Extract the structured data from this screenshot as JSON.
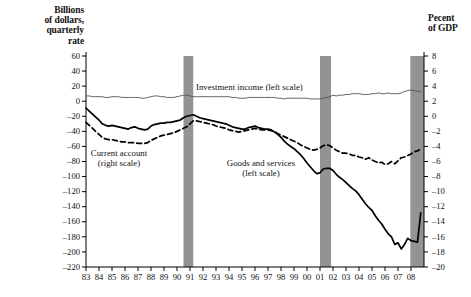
{
  "left_axis": {
    "title": "Billions\nof dollars,\nquarterly\nrate",
    "title_lines": [
      "Billions",
      "of dollars,",
      "quarterly",
      "rate"
    ],
    "ticks": [
      60,
      40,
      20,
      0,
      -20,
      -40,
      -60,
      -80,
      -100,
      -120,
      -140,
      -160,
      -180,
      -200,
      -220
    ],
    "min": -220,
    "max": 60
  },
  "right_axis": {
    "title_lines": [
      "Pecent",
      "of GDP"
    ],
    "ticks": [
      8,
      6,
      4,
      2,
      0,
      -2,
      -4,
      -6,
      -8,
      -10,
      -12,
      -14,
      -16,
      -18,
      -20
    ],
    "min": -20,
    "max": 8
  },
  "x_axis": {
    "labels": [
      "83",
      "84",
      "85",
      "86",
      "87",
      "88",
      "89",
      "90",
      "91",
      "92",
      "93",
      "94",
      "95",
      "96",
      "97",
      "98",
      "99",
      "00",
      "01",
      "02",
      "03",
      "04",
      "05",
      "06",
      "07",
      "08"
    ],
    "min": 1983,
    "max": 2009
  },
  "series_labels": {
    "investment": "Investment income (left scale)",
    "current_account_line1": "Current account",
    "current_account_line2": "(right scale)",
    "goods_line1": "Goods and services",
    "goods_line2": "(left scale)"
  },
  "colors": {
    "investment_income": "#555555",
    "goods_services": "#000000",
    "current_account": "#000000",
    "recession_band": "#939393",
    "axis": "#000000",
    "background": "#ffffff"
  },
  "recessions": [
    {
      "start": 1990.5,
      "end": 1991.25
    },
    {
      "start": 2001.0,
      "end": 2001.85
    },
    {
      "start": 2007.95,
      "end": 2009.0
    }
  ],
  "chart_data": {
    "type": "line",
    "title": "",
    "xlabel": "",
    "ylabel": "Billions of dollars, quarterly rate",
    "ylabel_right": "Pecent of GDP",
    "ylim": [
      -220,
      60
    ],
    "ylim_right": [
      -20,
      8
    ],
    "xlim": [
      1983,
      2009
    ],
    "grid": false,
    "legend": "inline-annotations",
    "x": [
      1983.0,
      1983.25,
      1983.5,
      1983.75,
      1984.0,
      1984.25,
      1984.5,
      1984.75,
      1985.0,
      1985.25,
      1985.5,
      1985.75,
      1986.0,
      1986.25,
      1986.5,
      1986.75,
      1987.0,
      1987.25,
      1987.5,
      1987.75,
      1988.0,
      1988.25,
      1988.5,
      1988.75,
      1989.0,
      1989.25,
      1989.5,
      1989.75,
      1990.0,
      1990.25,
      1990.5,
      1990.75,
      1991.0,
      1991.25,
      1991.5,
      1991.75,
      1992.0,
      1992.25,
      1992.5,
      1992.75,
      1993.0,
      1993.25,
      1993.5,
      1993.75,
      1994.0,
      1994.25,
      1994.5,
      1994.75,
      1995.0,
      1995.25,
      1995.5,
      1995.75,
      1996.0,
      1996.25,
      1996.5,
      1996.75,
      1997.0,
      1997.25,
      1997.5,
      1997.75,
      1998.0,
      1998.25,
      1998.5,
      1998.75,
      1999.0,
      1999.25,
      1999.5,
      1999.75,
      2000.0,
      2000.25,
      2000.5,
      2000.75,
      2001.0,
      2001.25,
      2001.5,
      2001.75,
      2002.0,
      2002.25,
      2002.5,
      2002.75,
      2003.0,
      2003.25,
      2003.5,
      2003.75,
      2004.0,
      2004.25,
      2004.5,
      2004.75,
      2005.0,
      2005.25,
      2005.5,
      2005.75,
      2006.0,
      2006.25,
      2006.5,
      2006.75,
      2007.0,
      2007.25,
      2007.5,
      2007.75,
      2008.0,
      2008.25,
      2008.5,
      2008.75
    ],
    "series": [
      {
        "name": "Investment income (left scale)",
        "axis": "left",
        "style": "solid-thin",
        "color": "#555555",
        "values": [
          7,
          7,
          6,
          6,
          6,
          6,
          5,
          5,
          6,
          6,
          6,
          5,
          5,
          5,
          5,
          5,
          5,
          4,
          4,
          5,
          6,
          7,
          7,
          6,
          6,
          5,
          5,
          5,
          6,
          7,
          8,
          8,
          7,
          6,
          6,
          6,
          6,
          6,
          6,
          6,
          6,
          6,
          6,
          6,
          6,
          5,
          5,
          4,
          4,
          4,
          5,
          5,
          5,
          5,
          5,
          5,
          5,
          5,
          5,
          4,
          4,
          3,
          4,
          4,
          4,
          4,
          4,
          4,
          4,
          3,
          3,
          3,
          3,
          4,
          5,
          6,
          8,
          7,
          8,
          8,
          9,
          9,
          10,
          10,
          10,
          9,
          9,
          9,
          10,
          10,
          11,
          10,
          10,
          11,
          10,
          10,
          10,
          11,
          13,
          14,
          15,
          14,
          13,
          13
        ]
      },
      {
        "name": "Goods and services (left scale)",
        "axis": "left",
        "style": "solid-thick",
        "color": "#000000",
        "values": [
          -9,
          -13,
          -17,
          -21,
          -25,
          -30,
          -32,
          -33,
          -32,
          -33,
          -34,
          -35,
          -36,
          -37,
          -35,
          -34,
          -36,
          -37,
          -38,
          -37,
          -33,
          -31,
          -30,
          -29,
          -29,
          -28,
          -28,
          -27,
          -26,
          -25,
          -22,
          -20,
          -19,
          -18,
          -20,
          -22,
          -23,
          -24,
          -25,
          -26,
          -27,
          -28,
          -29,
          -30,
          -32,
          -34,
          -35,
          -36,
          -37,
          -37,
          -35,
          -34,
          -33,
          -35,
          -36,
          -37,
          -37,
          -38,
          -41,
          -44,
          -48,
          -53,
          -57,
          -60,
          -63,
          -67,
          -71,
          -76,
          -82,
          -87,
          -92,
          -96,
          -95,
          -90,
          -89,
          -89,
          -92,
          -97,
          -101,
          -104,
          -108,
          -112,
          -116,
          -119,
          -124,
          -130,
          -136,
          -141,
          -145,
          -152,
          -158,
          -163,
          -170,
          -176,
          -180,
          -190,
          -188,
          -196,
          -190,
          -182,
          -185,
          -186,
          -187,
          -148
        ]
      },
      {
        "name": "Current account (right scale)",
        "axis": "right",
        "style": "dashed",
        "color": "#000000",
        "values": [
          -0.8,
          -1.2,
          -1.6,
          -2.0,
          -2.4,
          -2.8,
          -3.0,
          -3.1,
          -3.1,
          -3.2,
          -3.3,
          -3.4,
          -3.4,
          -3.5,
          -3.5,
          -3.5,
          -3.6,
          -3.6,
          -3.6,
          -3.5,
          -3.2,
          -3.0,
          -2.8,
          -2.6,
          -2.5,
          -2.4,
          -2.3,
          -2.2,
          -2.0,
          -1.8,
          -1.6,
          -1.4,
          -1.0,
          -0.6,
          -0.6,
          -0.7,
          -0.8,
          -0.9,
          -1.0,
          -1.1,
          -1.3,
          -1.4,
          -1.5,
          -1.6,
          -1.8,
          -1.9,
          -2.0,
          -2.1,
          -2.0,
          -1.9,
          -1.8,
          -1.7,
          -1.6,
          -1.7,
          -1.8,
          -1.8,
          -1.8,
          -1.9,
          -2.0,
          -2.3,
          -2.5,
          -2.7,
          -2.9,
          -3.1,
          -3.3,
          -3.5,
          -3.8,
          -4.0,
          -4.2,
          -4.4,
          -4.5,
          -4.4,
          -4.2,
          -3.9,
          -3.8,
          -3.9,
          -4.2,
          -4.5,
          -4.7,
          -4.9,
          -4.9,
          -5.0,
          -5.2,
          -5.2,
          -5.4,
          -5.5,
          -5.7,
          -5.5,
          -5.8,
          -6.0,
          -6.2,
          -6.1,
          -6.4,
          -6.3,
          -6.0,
          -6.3,
          -5.9,
          -5.5,
          -5.4,
          -5.2,
          -5.0,
          -4.7,
          -4.6,
          -4.3
        ]
      }
    ]
  },
  "source_note": ""
}
